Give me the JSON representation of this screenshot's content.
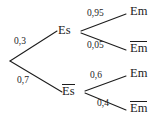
{
  "diagram": {
    "type": "probability-tree",
    "title": "",
    "background_color": "#ffffff",
    "line_color": "#1c1c1c",
    "text_color": "#1c1c1c",
    "decimal_separator": ",",
    "root": {
      "name": "root-node",
      "label": ""
    },
    "level1": [
      {
        "node_label": "Es",
        "overline": false,
        "probability": "0,3"
      },
      {
        "node_label": "Es",
        "overline": true,
        "probability": "0,7"
      }
    ],
    "level2": [
      {
        "parent": "Es",
        "node_label": "Em",
        "overline": false,
        "probability": "0,95"
      },
      {
        "parent": "Es",
        "node_label": "Em",
        "overline": true,
        "probability": "0,05"
      },
      {
        "parent": "Es-bar",
        "node_label": "Em",
        "overline": false,
        "probability": "0,6"
      },
      {
        "parent": "Es-bar",
        "node_label": "Em",
        "overline": true,
        "probability": "0,4"
      }
    ]
  }
}
